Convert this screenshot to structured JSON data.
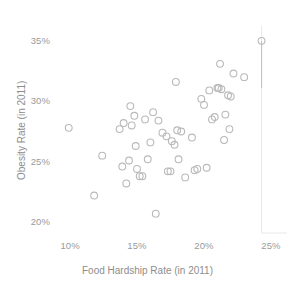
{
  "chart_data": {
    "type": "scatter",
    "title": "",
    "xlabel": "Food Hardship Rate (in 2011)",
    "ylabel": "Obesity Rate (in 2011)",
    "xlim": [
      8.8,
      26.2
    ],
    "ylim": [
      19.0,
      35.8
    ],
    "grid": false,
    "legend": null,
    "x_ticks": [
      "10%",
      "15%",
      "20%",
      "25%"
    ],
    "x_tick_values": [
      10,
      15,
      20,
      25
    ],
    "y_ticks": [
      "20%",
      "25%",
      "30%",
      "35%"
    ],
    "y_tick_values": [
      20,
      25,
      30,
      35
    ],
    "marker": "open-circle",
    "marker_color": "#b9b9b9",
    "series": [
      {
        "name": "States",
        "points": [
          [
            9.9,
            27.7
          ],
          [
            11.8,
            22.1
          ],
          [
            12.4,
            25.4
          ],
          [
            13.7,
            27.6
          ],
          [
            13.9,
            24.5
          ],
          [
            14.0,
            28.1
          ],
          [
            14.2,
            23.1
          ],
          [
            14.4,
            25.0
          ],
          [
            14.5,
            29.5
          ],
          [
            14.6,
            27.9
          ],
          [
            14.8,
            28.7
          ],
          [
            14.9,
            26.2
          ],
          [
            15.0,
            24.3
          ],
          [
            15.2,
            23.7
          ],
          [
            15.4,
            23.7
          ],
          [
            15.6,
            28.4
          ],
          [
            15.8,
            25.1
          ],
          [
            16.0,
            26.5
          ],
          [
            16.2,
            29.0
          ],
          [
            16.4,
            20.6
          ],
          [
            16.6,
            28.3
          ],
          [
            16.9,
            27.3
          ],
          [
            17.2,
            27.0
          ],
          [
            17.3,
            24.1
          ],
          [
            17.5,
            24.1
          ],
          [
            17.6,
            26.6
          ],
          [
            17.8,
            26.3
          ],
          [
            17.9,
            31.5
          ],
          [
            18.0,
            27.5
          ],
          [
            18.1,
            25.1
          ],
          [
            18.3,
            27.4
          ],
          [
            18.6,
            23.6
          ],
          [
            19.1,
            26.9
          ],
          [
            19.3,
            24.2
          ],
          [
            19.5,
            24.3
          ],
          [
            19.8,
            30.1
          ],
          [
            20.0,
            29.6
          ],
          [
            20.2,
            24.4
          ],
          [
            20.4,
            30.8
          ],
          [
            20.6,
            28.4
          ],
          [
            20.8,
            28.6
          ],
          [
            21.0,
            31.0
          ],
          [
            21.1,
            31.0
          ],
          [
            21.2,
            33.0
          ],
          [
            21.3,
            30.9
          ],
          [
            21.5,
            26.7
          ],
          [
            21.6,
            28.8
          ],
          [
            21.8,
            30.4
          ],
          [
            21.9,
            27.6
          ],
          [
            22.0,
            30.3
          ],
          [
            22.2,
            32.2
          ],
          [
            23.0,
            31.9
          ],
          [
            24.3,
            34.9
          ]
        ]
      }
    ],
    "annotations": [
      {
        "type": "vertical-line",
        "x": 24.3,
        "y_top": 34.9,
        "y_bottom": 31.0
      }
    ],
    "highlighted_points": [
      [
        17.2,
        24.1
      ]
    ]
  },
  "axis": {
    "y_axis_line_x": 24.3,
    "x_axis_line_y": 19.0
  }
}
